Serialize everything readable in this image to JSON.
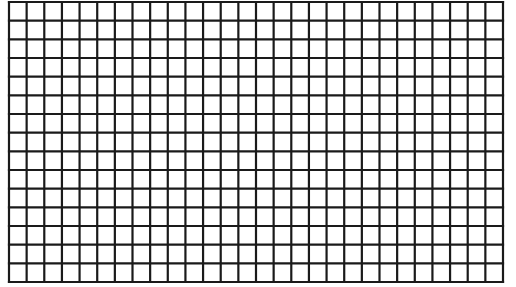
{
  "grid": {
    "columns": 28,
    "rows": 15,
    "left": 9,
    "top": 2,
    "right": 503,
    "bottom": 282,
    "line_color": "#1a1a1a",
    "line_width": 2.2,
    "background": "#ffffff"
  }
}
